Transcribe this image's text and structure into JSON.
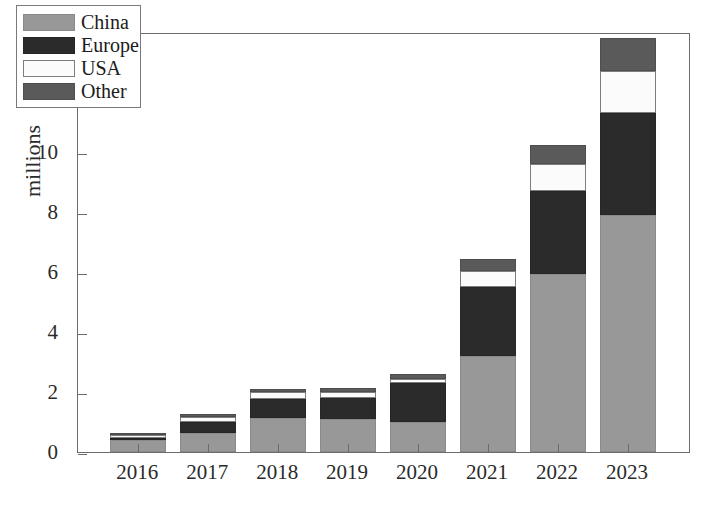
{
  "chart_data": {
    "type": "bar",
    "stacked": true,
    "title": "",
    "xlabel": "",
    "ylabel": "millions",
    "categories": [
      "2016",
      "2017",
      "2018",
      "2019",
      "2020",
      "2021",
      "2022",
      "2023"
    ],
    "series": [
      {
        "name": "China",
        "color": "#989898",
        "values": [
          0.4,
          0.65,
          1.15,
          1.1,
          1.0,
          3.2,
          5.95,
          7.9
        ]
      },
      {
        "name": "Europe",
        "color": "#2b2b2b",
        "values": [
          0.08,
          0.35,
          0.62,
          0.7,
          1.3,
          2.3,
          2.75,
          3.4
        ]
      },
      {
        "name": "USA",
        "color": "#fbfbfb",
        "values": [
          0.1,
          0.17,
          0.22,
          0.21,
          0.15,
          0.55,
          0.9,
          1.4
        ]
      },
      {
        "name": "Other",
        "color": "#5a5a5a",
        "values": [
          0.05,
          0.1,
          0.11,
          0.14,
          0.15,
          0.4,
          0.65,
          1.1
        ]
      }
    ],
    "totals": [
      0.63,
      1.27,
      2.1,
      2.15,
      2.6,
      6.45,
      10.25,
      13.8
    ],
    "ylim": [
      0,
      14
    ],
    "yticks": [
      0,
      2,
      4,
      6,
      8,
      10,
      12,
      14
    ],
    "ytick_labels": [
      "0",
      "2",
      "4",
      "6",
      "8",
      "10",
      "12",
      "14"
    ],
    "grid": false,
    "legend_position": "upper-left",
    "legend_entries": [
      "China",
      "Europe",
      "USA",
      "Other"
    ]
  },
  "axes": {
    "y_title": "millions"
  },
  "legend": {
    "items": [
      {
        "label": "China"
      },
      {
        "label": "Europe"
      },
      {
        "label": "USA"
      },
      {
        "label": "Other"
      }
    ]
  }
}
